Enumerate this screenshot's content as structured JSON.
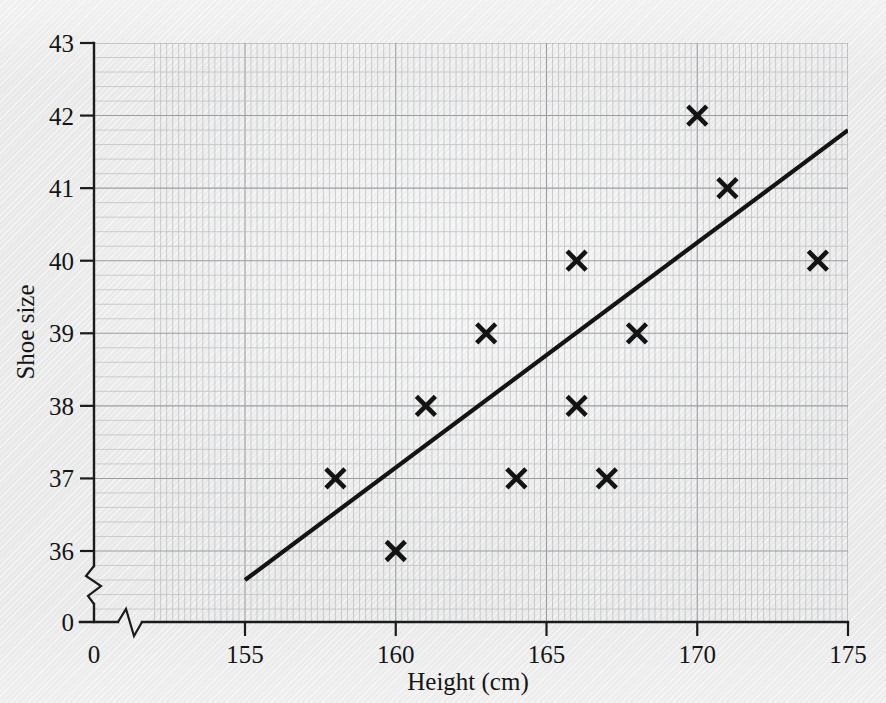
{
  "chart_data": {
    "type": "scatter",
    "title": "",
    "xlabel": "Height (cm)",
    "ylabel": "Shoe size",
    "xlim": [
      155,
      175
    ],
    "ylim": [
      36,
      43
    ],
    "xticks": [
      155,
      160,
      165,
      170,
      175
    ],
    "yticks": [
      36,
      37,
      38,
      39,
      40,
      41,
      42,
      43
    ],
    "x_origin_label": "0",
    "y_origin_label": "0",
    "axis_break_x": true,
    "axis_break_y": true,
    "grid": true,
    "grid_minor_step_x": 1,
    "grid_minor_step_y": 0.2,
    "legend": "none",
    "marker_style": "x",
    "points": [
      {
        "x": 158,
        "y": 37
      },
      {
        "x": 160,
        "y": 36
      },
      {
        "x": 161,
        "y": 38
      },
      {
        "x": 163,
        "y": 39
      },
      {
        "x": 164,
        "y": 37
      },
      {
        "x": 166,
        "y": 40
      },
      {
        "x": 166,
        "y": 38
      },
      {
        "x": 167,
        "y": 37
      },
      {
        "x": 168,
        "y": 39
      },
      {
        "x": 170,
        "y": 42
      },
      {
        "x": 171,
        "y": 41
      },
      {
        "x": 174,
        "y": 40
      }
    ],
    "trend_line": {
      "label": "line of best fit",
      "x1": 155,
      "y1": 35.6,
      "x2": 175,
      "y2": 41.8
    },
    "colors": {
      "ink": "#141414",
      "grid_minor": "#b9bcbe",
      "grid_major": "#9a9da0",
      "paper": "#e9e9e9"
    }
  },
  "axis": {
    "y_title": "Shoe size",
    "x_title": "Height (cm)",
    "y_tick_labels": [
      "43",
      "42",
      "41",
      "40",
      "39",
      "38",
      "37",
      "36",
      "0"
    ],
    "x_tick_labels": [
      "0",
      "155",
      "160",
      "165",
      "170",
      "175"
    ]
  }
}
